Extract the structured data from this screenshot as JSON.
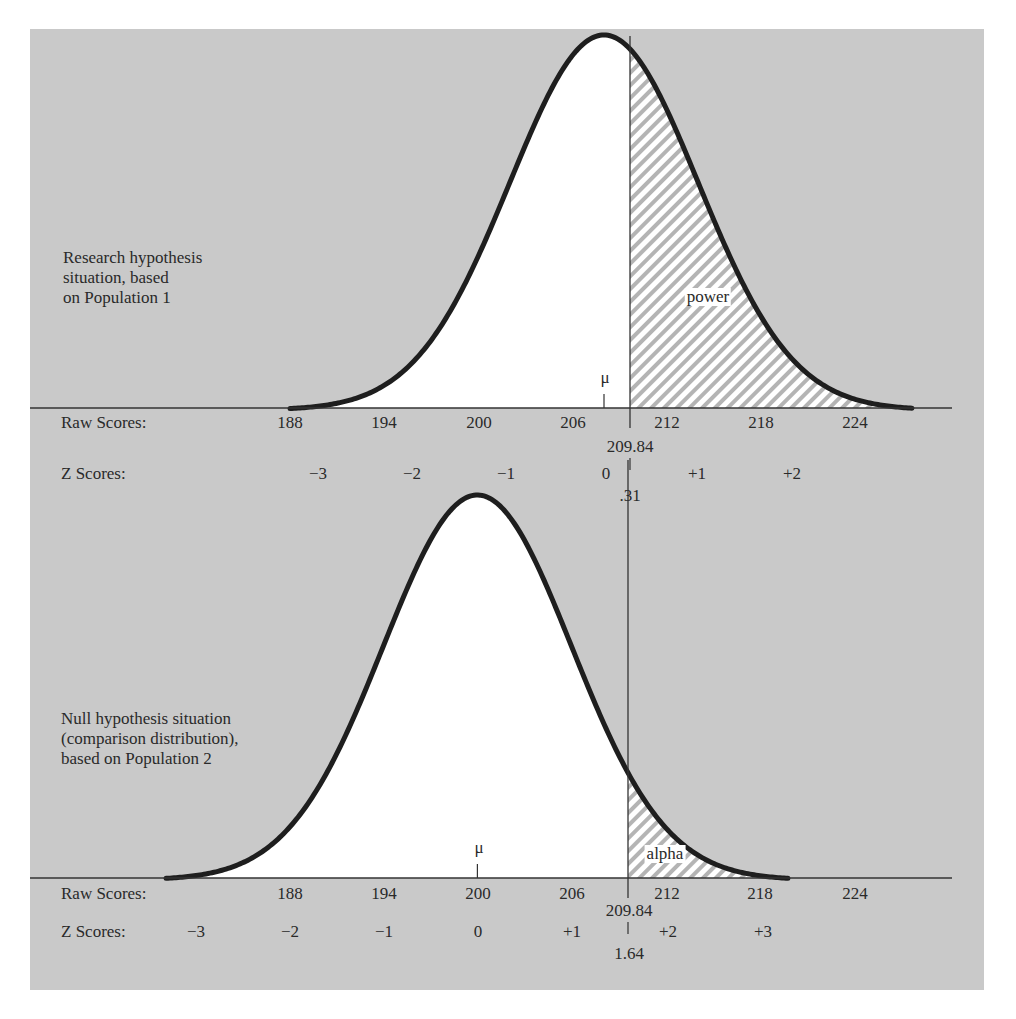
{
  "chart_data": {
    "type": "area",
    "title": "",
    "panels": [
      {
        "name": "research",
        "description": [
          "Research hypothesis",
          "situation, based",
          "on Population 1"
        ],
        "distribution": "normal",
        "mean": 208,
        "sd": 6,
        "mean_label": "μ",
        "cutoff_raw": "209.84",
        "cutoff_z": ".31",
        "shaded_region": "right of cutoff",
        "shaded_label": "power",
        "raw_axis_label": "Raw Scores:",
        "raw_ticks": [
          "188",
          "194",
          "200",
          "206",
          "212",
          "218",
          "224"
        ],
        "z_axis_label": "Z Scores:",
        "z_ticks": [
          "−3",
          "−2",
          "−1",
          "0",
          "+1",
          "+2"
        ]
      },
      {
        "name": "null",
        "description": [
          "Null hypothesis situation",
          "(comparison distribution),",
          "based on Population 2"
        ],
        "distribution": "normal",
        "mean": 200,
        "sd": 6,
        "mean_label": "μ",
        "cutoff_raw": "209.84",
        "cutoff_z": "1.64",
        "shaded_region": "right of cutoff",
        "shaded_label": "alpha",
        "raw_axis_label": "Raw Scores:",
        "raw_ticks": [
          "188",
          "194",
          "200",
          "206",
          "212",
          "218",
          "224"
        ],
        "z_axis_label": "Z Scores:",
        "z_ticks": [
          "−3",
          "−2",
          "−1",
          "0",
          "+1",
          "+2",
          "+3"
        ]
      }
    ],
    "xlabel": "Raw Scores / Z Scores",
    "ylabel": "",
    "grid": false,
    "legend": "none"
  },
  "colors": {
    "background": "#c9c9c9",
    "curve": "#1e1e1e",
    "fill": "#ffffff",
    "hatch": "#b4b4b4"
  }
}
